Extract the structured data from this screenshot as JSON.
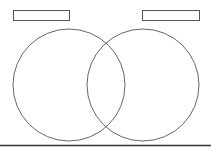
{
  "diagram": {
    "type": "venn",
    "sets": [
      {
        "id": "A",
        "label": "",
        "label_box": {
          "x": 13,
          "y": 10,
          "w": 56,
          "h": 10
        },
        "circle": {
          "cx": 69,
          "cy": 85,
          "r": 56
        }
      },
      {
        "id": "B",
        "label": "",
        "label_box": {
          "x": 142,
          "y": 10,
          "w": 57,
          "h": 10
        },
        "circle": {
          "cx": 143,
          "cy": 85,
          "r": 56
        }
      }
    ],
    "stroke_color": "#555555",
    "baseline_color": "#333333"
  }
}
